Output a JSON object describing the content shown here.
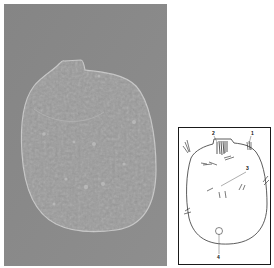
{
  "figure": {
    "panels": [
      {
        "id": "micrograph",
        "type": "photo",
        "description": "DIC micrograph of a ciliate cell",
        "background_color": "#8a8a8a",
        "cell_color": "#9a9a9a"
      },
      {
        "id": "schematic",
        "type": "line-drawing",
        "labels": [
          "1",
          "2",
          "3",
          "4"
        ]
      }
    ]
  }
}
